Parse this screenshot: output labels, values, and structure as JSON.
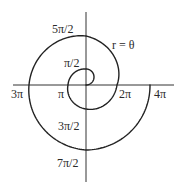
{
  "diagram": {
    "equation_label": "r = θ",
    "stroke_color": "#222222",
    "axes": {
      "origin": [
        86,
        85
      ],
      "horizontal": {
        "x1": 13,
        "x2": 174
      },
      "vertical": {
        "y1": 12,
        "y2": 182
      }
    },
    "labels": [
      {
        "id": "pi-over-2",
        "text": "π/2",
        "x": 64,
        "y": 67
      },
      {
        "id": "pi",
        "text": "π",
        "x": 58,
        "y": 98
      },
      {
        "id": "three-pi-over-2",
        "text": "3π/2",
        "x": 58,
        "y": 130
      },
      {
        "id": "two-pi",
        "text": "2π",
        "x": 119,
        "y": 98
      },
      {
        "id": "five-pi-over-2",
        "text": "5π/2",
        "x": 52,
        "y": 33
      },
      {
        "id": "three-pi",
        "text": "3π",
        "x": 11,
        "y": 98
      },
      {
        "id": "seven-pi-over-2",
        "text": "7π/2",
        "x": 57,
        "y": 167
      },
      {
        "id": "four-pi",
        "text": "4π",
        "x": 154,
        "y": 98
      }
    ],
    "spiral_keypoints": [
      {
        "theta_over_pi": 0,
        "r": 0
      },
      {
        "theta_over_pi": 0.5,
        "r": 16
      },
      {
        "theta_over_pi": 1,
        "r": 18
      },
      {
        "theta_over_pi": 1.5,
        "r": 24
      },
      {
        "theta_over_pi": 2,
        "r": 31
      },
      {
        "theta_over_pi": 2.5,
        "r": 49
      },
      {
        "theta_over_pi": 3,
        "r": 57
      },
      {
        "theta_over_pi": 3.5,
        "r": 65
      },
      {
        "theta_over_pi": 4,
        "r": 64
      }
    ]
  }
}
